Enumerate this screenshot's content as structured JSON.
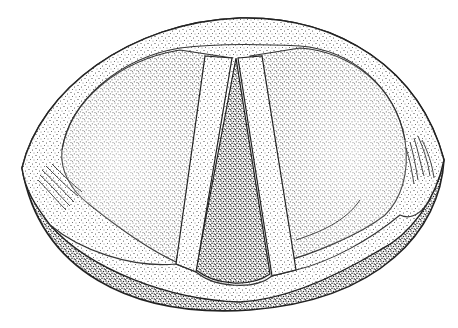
{
  "image": {
    "subject": "stippled anatomical illustration",
    "width": 458,
    "height": 328,
    "background": "#ffffff",
    "ink": "#222222"
  }
}
